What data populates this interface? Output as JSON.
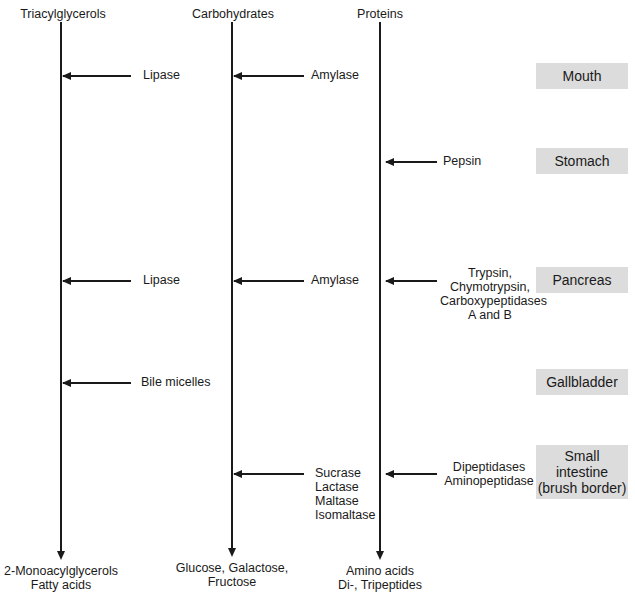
{
  "columns": [
    {
      "title": "Triacylglycerols",
      "products": [
        "2-Monoacylglycerols",
        "Fatty acids"
      ]
    },
    {
      "title": "Carbohydrates",
      "products": [
        "Glucose, Galactose,",
        "Fructose"
      ]
    },
    {
      "title": "Proteins",
      "products": [
        "Amino acids",
        "Di-, Tripeptides"
      ]
    }
  ],
  "organs": [
    "Mouth",
    "Stomach",
    "Pancreas",
    "Gallbladder",
    "Small intestine (brush border)"
  ],
  "organ_lines": {
    "small_intestine": [
      "Small",
      "intestine",
      "(brush border)"
    ]
  },
  "enzymes": {
    "mouth": {
      "lipid": "Lipase",
      "carb": "Amylase"
    },
    "stomach": {
      "protein": "Pepsin"
    },
    "pancreas": {
      "lipid": "Lipase",
      "carb": "Amylase",
      "protein": [
        "Trypsin,",
        "Chymotrypsin,",
        "Carboxypeptidases",
        "A and B"
      ]
    },
    "gallbladder": {
      "lipid": "Bile micelles"
    },
    "small_intestine": {
      "carb": [
        "Sucrase",
        "Lactase",
        "Maltase",
        "Isomaltase"
      ],
      "protein": [
        "Dipeptidases",
        "Aminopeptidase"
      ]
    }
  },
  "colors": {
    "line": "#1a1a1a",
    "organ_box": "#dcdcdc"
  }
}
